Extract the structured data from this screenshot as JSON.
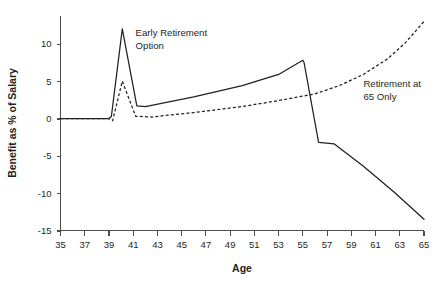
{
  "chart_data": {
    "type": "line",
    "title": "",
    "xlabel": "Age",
    "ylabel": "Benefit as % of Salary",
    "xlim": [
      35,
      65
    ],
    "ylim": [
      -15,
      14
    ],
    "grid": false,
    "legend_position": "inline-annotations",
    "x_ticks": [
      35,
      37,
      39,
      41,
      43,
      45,
      47,
      49,
      51,
      53,
      55,
      57,
      59,
      61,
      63,
      65
    ],
    "x_tick_labels": [
      "35",
      "37",
      "39",
      "41",
      "43",
      "45",
      "47",
      "49",
      "51",
      "53",
      "55",
      "57",
      "59",
      "61",
      "63",
      "65"
    ],
    "y_ticks": [
      10,
      5,
      0,
      -5,
      -10,
      -15
    ],
    "y_tick_labels": [
      "10",
      "5",
      "0",
      "-5",
      "-10",
      "-15"
    ],
    "annotations": [
      {
        "name": "early-retirement-option",
        "lines": [
          "Early Retirement",
          "Option"
        ],
        "x": 41.2,
        "y": 11.0
      },
      {
        "name": "retirement-at-65-only",
        "lines": [
          "Retirement at",
          "65 Only"
        ],
        "x": 60.0,
        "y": 4.2
      }
    ],
    "series": [
      {
        "name": "Early Retirement Option",
        "style": "solid",
        "points": [
          [
            35.0,
            0.0
          ],
          [
            39.0,
            0.0
          ],
          [
            39.2,
            0.3
          ],
          [
            40.1,
            12.0
          ],
          [
            41.3,
            1.7
          ],
          [
            42.0,
            1.6
          ],
          [
            46.0,
            2.9
          ],
          [
            50.0,
            4.4
          ],
          [
            53.0,
            5.9
          ],
          [
            55.0,
            7.8
          ],
          [
            55.1,
            7.5
          ],
          [
            56.3,
            -3.2
          ],
          [
            57.6,
            -3.4
          ],
          [
            60.0,
            -6.4
          ],
          [
            62.5,
            -9.8
          ],
          [
            65.0,
            -13.5
          ]
        ]
      },
      {
        "name": "Retirement at 65 Only",
        "style": "dashed",
        "points": [
          [
            35.0,
            0.0
          ],
          [
            39.0,
            0.0
          ],
          [
            39.3,
            -0.3
          ],
          [
            40.1,
            5.0
          ],
          [
            41.2,
            0.3
          ],
          [
            42.5,
            0.2
          ],
          [
            46.0,
            0.8
          ],
          [
            50.0,
            1.6
          ],
          [
            53.0,
            2.4
          ],
          [
            56.0,
            3.3
          ],
          [
            58.0,
            4.4
          ],
          [
            60.0,
            5.9
          ],
          [
            62.0,
            8.0
          ],
          [
            63.5,
            10.2
          ],
          [
            65.0,
            13.0
          ]
        ]
      }
    ]
  }
}
